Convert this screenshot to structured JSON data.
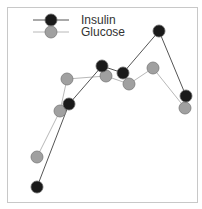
{
  "chart_data": {
    "type": "line",
    "title": "",
    "xlabel": "",
    "ylabel": "",
    "grid": false,
    "axes_visible": false,
    "legend_position": "top-left (inside plot)",
    "frame": {
      "x": 7,
      "y": 7,
      "width": 190,
      "height": 195,
      "stroke": "#c8c8c8"
    },
    "pixel_scale_note": "no axes shown; values are normalized 0-100 with 0 at frame bottom (y=202) and 100 at frame top (y=7)",
    "series": [
      {
        "name": "Insulin",
        "line_color": "#555555",
        "marker_fill": "#1a1a1a",
        "marker_stroke": "#666666",
        "points": [
          {
            "px": 37,
            "py": 187,
            "value": 8
          },
          {
            "px": 69,
            "py": 104,
            "value": 50
          },
          {
            "px": 102,
            "py": 66,
            "value": 70
          },
          {
            "px": 123,
            "py": 73,
            "value": 66
          },
          {
            "px": 159,
            "py": 31,
            "value": 88
          },
          {
            "px": 186,
            "py": 96,
            "value": 54
          }
        ]
      },
      {
        "name": "Glucose",
        "line_color": "#b8b8b8",
        "marker_fill": "#a0a0a0",
        "marker_stroke": "#7a7a7a",
        "points": [
          {
            "px": 37,
            "py": 157,
            "value": 23
          },
          {
            "px": 60,
            "py": 111,
            "value": 47
          },
          {
            "px": 67,
            "py": 79,
            "value": 63
          },
          {
            "px": 106,
            "py": 76,
            "value": 65
          },
          {
            "px": 129,
            "py": 84,
            "value": 61
          },
          {
            "px": 153,
            "py": 68,
            "value": 69
          },
          {
            "px": 185,
            "py": 108,
            "value": 48
          }
        ]
      }
    ],
    "legend": {
      "entries": [
        {
          "label": "Insulin",
          "series_index": 0,
          "line_x1": 33,
          "line_x2": 69,
          "marker_x": 51,
          "y": 20,
          "text_x": 81
        },
        {
          "label": "Glucose",
          "series_index": 1,
          "line_x1": 33,
          "line_x2": 69,
          "marker_x": 51,
          "y": 32,
          "text_x": 81
        }
      ]
    },
    "marker_radius": 6
  }
}
